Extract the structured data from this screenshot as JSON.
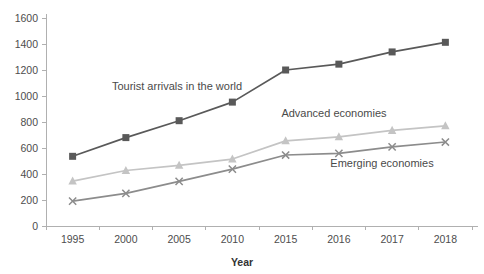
{
  "chart_data": {
    "type": "line",
    "title": "",
    "subtitle": "",
    "xlabel": "Year",
    "ylabel": "",
    "categories": [
      "1995",
      "2000",
      "2005",
      "2010",
      "2015",
      "2016",
      "2017",
      "2018"
    ],
    "ylim": [
      0,
      1600
    ],
    "y_ticks": [
      0,
      200,
      400,
      600,
      800,
      1000,
      1200,
      1400,
      1600
    ],
    "y_tick_labels": [
      "0",
      "200",
      "400",
      "600",
      "800",
      "1000",
      "1200",
      "1400",
      "1600"
    ],
    "grid": false,
    "legend_position": "inline-annotations",
    "series": [
      {
        "name": "Tourist arrivals in the world",
        "color": "#595959",
        "marker": "square",
        "values": [
          536,
          680,
          810,
          953,
          1200,
          1245,
          1339,
          1413
        ]
      },
      {
        "name": "Advanced economies",
        "color": "#c4c4c4",
        "marker": "triangle",
        "values": [
          345,
          427,
          466,
          515,
          655,
          686,
          735,
          770
        ]
      },
      {
        "name": "Emerging economies",
        "color": "#8c8c8c",
        "marker": "x",
        "values": [
          191,
          251,
          343,
          438,
          546,
          559,
          609,
          646
        ]
      }
    ],
    "annotations": [
      {
        "text": "Tourist arrivals in the world",
        "x_px": 177,
        "y_px": 90
      },
      {
        "text": "Advanced economies",
        "x_px": 334,
        "y_px": 117
      },
      {
        "text": "Emerging economies",
        "x_px": 382,
        "y_px": 167
      }
    ]
  },
  "axes": {
    "x_axis_title": "Year",
    "x_tick_labels": [
      "1995",
      "2000",
      "2005",
      "2010",
      "2015",
      "2016",
      "2017",
      "2018"
    ],
    "y_tick_labels": [
      "0",
      "200",
      "400",
      "600",
      "800",
      "1000",
      "1200",
      "1400",
      "1600"
    ]
  }
}
